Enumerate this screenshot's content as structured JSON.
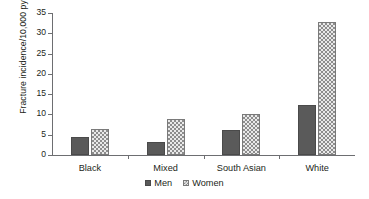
{
  "chart_data": {
    "type": "bar",
    "title": "",
    "subtitle": "",
    "xlabel": "",
    "ylabel": "Fracture incidence/10,000 py",
    "categories": [
      "Black",
      "Mixed",
      "South Asian",
      "White"
    ],
    "series": [
      {
        "name": "Men",
        "values": [
          4.4,
          3.1,
          6.2,
          12.4
        ],
        "color": "#5a5a5a",
        "fill": "solid"
      },
      {
        "name": "Women",
        "values": [
          6.4,
          8.9,
          10.2,
          32.8
        ],
        "color": "#8d8d8d",
        "fill": "crosshatch"
      }
    ],
    "ylim": [
      0,
      35
    ],
    "yticks": [
      0,
      5,
      10,
      15,
      20,
      25,
      30,
      35
    ],
    "ytick_labels": [
      "0",
      "5",
      "10",
      "15",
      "20",
      "25",
      "30",
      "35"
    ],
    "grid": false,
    "legend_position": "bottom"
  },
  "legend": {
    "items": [
      {
        "label": "Men",
        "swatch": "men-swatch-icon"
      },
      {
        "label": "Women",
        "swatch": "women-swatch-icon"
      }
    ]
  }
}
